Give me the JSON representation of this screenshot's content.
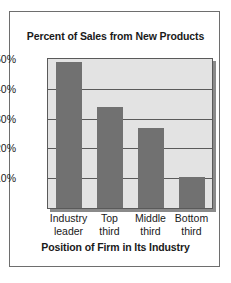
{
  "chart_data": {
    "type": "bar",
    "title": "Percent of Sales from New Products",
    "xlabel": "Position of Firm in Its Industry",
    "ylabel": "",
    "categories": [
      "Industry leader",
      "Top third",
      "Middle third",
      "Bottom third"
    ],
    "category_lines": [
      [
        "Industry",
        "leader"
      ],
      [
        "Top",
        "third"
      ],
      [
        "Middle",
        "third"
      ],
      [
        "Bottom",
        "third"
      ]
    ],
    "values": [
      49,
      34,
      27,
      10.5
    ],
    "ylim": [
      0,
      50
    ],
    "ytick_values": [
      50,
      40,
      30,
      20,
      10
    ],
    "ytick_labels": [
      "50%",
      "40%",
      "30%",
      "20%",
      "10%"
    ],
    "grid": true,
    "legend": false,
    "colors": {
      "bar": "#717171",
      "plot_background": "#e3e3e3",
      "gridline": "#5a5a5a",
      "panel_border": "#6e6e6e",
      "text": "#1a1a1a",
      "shadow": "#8a8a8a"
    }
  }
}
